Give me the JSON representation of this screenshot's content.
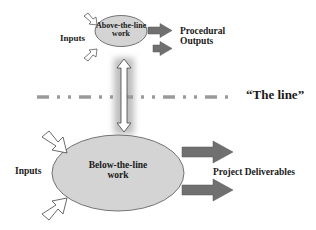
{
  "diagram": {
    "above": {
      "node_label_line1": "Above-the-line",
      "node_label_line2": "work",
      "inputs_label": "Inputs",
      "outputs_label_line1": "Procedural",
      "outputs_label_line2": "Outputs"
    },
    "divider": {
      "label": "“The line”"
    },
    "below": {
      "node_label_line1": "Below-the-line",
      "node_label_line2": "work",
      "inputs_label": "Inputs",
      "outputs_label": "Project Deliverables"
    },
    "colors": {
      "ellipse_fill": "#d4d4d4",
      "ellipse_stroke": "#555555",
      "output_arrow": "#707070",
      "dashed_line": "#9a9a9a",
      "glow": "#bdbdbd"
    }
  }
}
